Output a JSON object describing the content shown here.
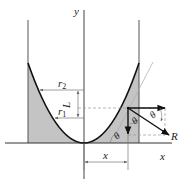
{
  "diagram": {
    "labels": {
      "y_axis": "y",
      "x_axis": "x",
      "r2": "r",
      "r2_sub": "2",
      "r1": "r",
      "r1_sub": "1",
      "L": "L",
      "x_dim": "x",
      "theta_1": "θ",
      "theta_2": "θ",
      "theta_3": "θ",
      "R": "R"
    },
    "colors": {
      "shade": "#c4c4c4",
      "line": "#111111",
      "guide": "#9a9a9a"
    }
  }
}
